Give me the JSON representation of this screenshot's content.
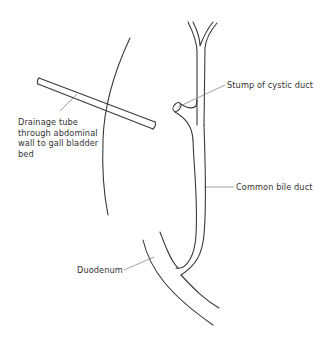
{
  "diagram": {
    "type": "anatomical-line-drawing",
    "stroke_color": "#3a3a3a",
    "leader_color": "#777777",
    "labels": {
      "drainage_tube": [
        "Drainage tube",
        "through abdominal",
        "wall to gall bladder",
        "bed"
      ],
      "cystic_stump": "Stump of cystic duct",
      "common_bile_duct": "Common bile duct",
      "duodenum": "Duodenum"
    }
  }
}
